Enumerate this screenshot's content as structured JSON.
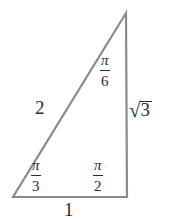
{
  "figure": {
    "stroke_color": "#8a8a8a",
    "text_color": "#2b2b2b",
    "background_color": "#ffffff"
  },
  "triangle": {
    "apex": {
      "x": 126,
      "y": 13
    },
    "bottom_left": {
      "x": 13,
      "y": 197
    },
    "bottom_right": {
      "x": 127,
      "y": 197
    }
  },
  "angles": {
    "top": {
      "numerator": "π",
      "denominator": "6"
    },
    "bottom_left": {
      "numerator": "π",
      "denominator": "3"
    },
    "bottom_right": {
      "numerator": "π",
      "denominator": "2"
    }
  },
  "sides": {
    "hypotenuse": "2",
    "base": "1",
    "vertical": {
      "radical_sign": "√",
      "radicand": "3"
    }
  }
}
